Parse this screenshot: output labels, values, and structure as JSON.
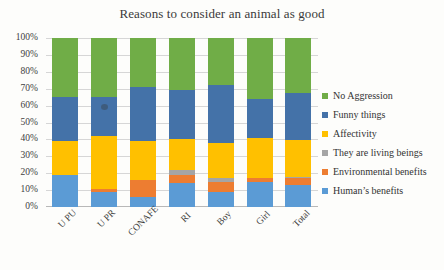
{
  "chart_data": {
    "type": "bar",
    "subtype": "stacked-100-percent",
    "title": "Reasons to consider an animal as good",
    "xlabel": "",
    "ylabel": "",
    "ylim": [
      0,
      100
    ],
    "grid": true,
    "legend_position": "right",
    "categories": [
      "U PU",
      "U PR",
      "CONAFE",
      "RI",
      "Boy",
      "Girl",
      "Total"
    ],
    "ytick_labels": [
      "0%",
      "10%",
      "20%",
      "30%",
      "40%",
      "50%",
      "60%",
      "70%",
      "80%",
      "90%",
      "100%"
    ],
    "ytick_values": [
      0,
      10,
      20,
      30,
      40,
      50,
      60,
      70,
      80,
      90,
      100
    ],
    "series": [
      {
        "name": "Human's benefits",
        "color": "#5B9BD5",
        "values": [
          19,
          9,
          6,
          14,
          9,
          15,
          13
        ]
      },
      {
        "name": "Environmental benefits",
        "color": "#ED7D31",
        "values": [
          0,
          1.5,
          10,
          5,
          6,
          2,
          4
        ]
      },
      {
        "name": "They are living beings",
        "color": "#A5A5A5",
        "values": [
          0,
          0,
          0,
          3,
          2,
          0,
          1
        ]
      },
      {
        "name": "Affectivity",
        "color": "#FFC000",
        "values": [
          20,
          31.5,
          23,
          18,
          21,
          24,
          21.5
        ]
      },
      {
        "name": "Funny things",
        "color": "#4472A8",
        "values": [
          26,
          23,
          32,
          29,
          34,
          23,
          28
        ]
      },
      {
        "name": "No Aggression",
        "color": "#70AD47",
        "values": [
          35,
          35,
          29,
          31,
          28,
          36,
          32.5
        ]
      }
    ]
  },
  "legend": {
    "items": [
      {
        "label": "No Aggression",
        "color": "#70AD47"
      },
      {
        "label": "Funny things",
        "color": "#4472A8"
      },
      {
        "label": "Affectivity",
        "color": "#FFC000"
      },
      {
        "label": "They are living beings",
        "color": "#A5A5A5"
      },
      {
        "label": "Environmental benefits",
        "color": "#ED7D31"
      },
      {
        "label": "Human’s benefits",
        "color": "#5B9BD5"
      }
    ]
  }
}
